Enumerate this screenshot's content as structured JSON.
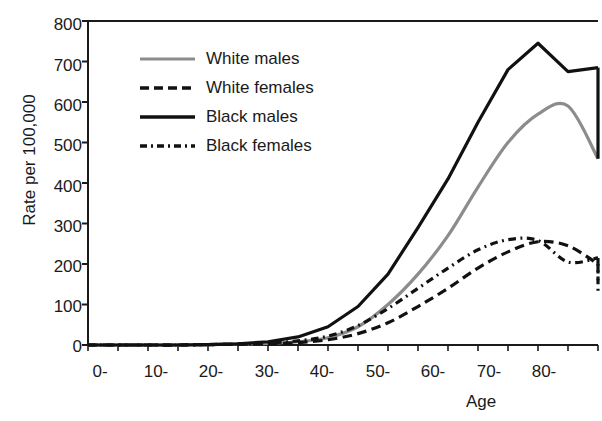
{
  "chart_data": {
    "type": "line",
    "title": "",
    "xlabel": "Age",
    "ylabel": "Rate per 100,000",
    "xtick_labels": [
      "0-",
      "10-",
      "20-",
      "30-",
      "40-",
      "50-",
      "60-",
      "70-",
      "80-"
    ],
    "ytick_labels": [
      "0",
      "100",
      "200",
      "300",
      "400",
      "500",
      "600",
      "700",
      "800"
    ],
    "ylim": [
      0,
      800
    ],
    "ytick_step": 100,
    "grid": false,
    "legend_position": "upper-left-inside",
    "x_categories": [
      "0-",
      "5-",
      "10-",
      "15-",
      "20-",
      "25-",
      "30-",
      "35-",
      "40-",
      "45-",
      "50-",
      "55-",
      "60-",
      "65-",
      "70-",
      "75-",
      "80-",
      "85+"
    ],
    "series": [
      {
        "name": "White males",
        "color": "#8c8c8c",
        "style": "solid",
        "width": 3,
        "values": [
          0,
          0,
          0,
          0,
          1,
          2,
          4,
          8,
          18,
          45,
          100,
          175,
          270,
          390,
          500,
          570,
          590,
          460
        ]
      },
      {
        "name": "White females",
        "color": "#111111",
        "style": "dashed",
        "width": 3,
        "values": [
          0,
          0,
          0,
          0,
          1,
          2,
          3,
          6,
          13,
          28,
          55,
          95,
          140,
          190,
          230,
          255,
          245,
          200
        ]
      },
      {
        "name": "Black males",
        "color": "#111111",
        "style": "solid",
        "width": 3,
        "values": [
          0,
          0,
          0,
          0,
          1,
          3,
          8,
          20,
          45,
          95,
          175,
          290,
          410,
          550,
          680,
          745,
          675,
          685
        ]
      },
      {
        "name": "Black females",
        "color": "#111111",
        "style": "dashdot",
        "width": 3,
        "values": [
          0,
          0,
          0,
          0,
          1,
          2,
          5,
          10,
          22,
          48,
          90,
          140,
          190,
          235,
          260,
          258,
          205,
          215
        ]
      }
    ],
    "series_endpoints": {
      "white_males_final": 460,
      "black_males_final": 460,
      "white_females_final": 160,
      "black_females_final": 130
    }
  },
  "legend": {
    "items": [
      {
        "label": "White males",
        "icon": "solid-gray-line-icon"
      },
      {
        "label": "White females",
        "icon": "dashed-black-line-icon"
      },
      {
        "label": "Black males",
        "icon": "solid-black-line-icon"
      },
      {
        "label": "Black females",
        "icon": "dashdot-black-line-icon"
      }
    ]
  }
}
